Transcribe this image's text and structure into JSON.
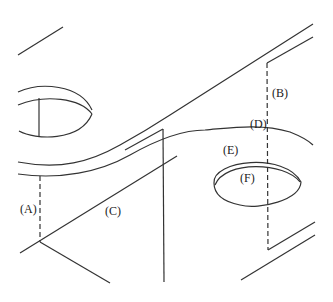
{
  "diagram": {
    "type": "isometric technical line drawing",
    "line_color": "#333333",
    "background": "#ffffff"
  },
  "labels": {
    "a": {
      "text": "(A)",
      "x": 20,
      "y": 203,
      "refers_to": "dashed vertical line at left"
    },
    "b": {
      "text": "(B)",
      "x": 272,
      "y": 87,
      "refers_to": "dashed vertical line at right"
    },
    "c": {
      "text": "(C)",
      "x": 105,
      "y": 205,
      "refers_to": "diagonal edge"
    },
    "d": {
      "text": "(D)",
      "x": 250,
      "y": 118,
      "refers_to": "intersection of dashed line and curve"
    },
    "e": {
      "text": "(E)",
      "x": 223,
      "y": 144,
      "refers_to": "outer ellipse of right hole"
    },
    "f": {
      "text": "(F)",
      "x": 240,
      "y": 172,
      "refers_to": "inner ellipse of right hole"
    }
  }
}
